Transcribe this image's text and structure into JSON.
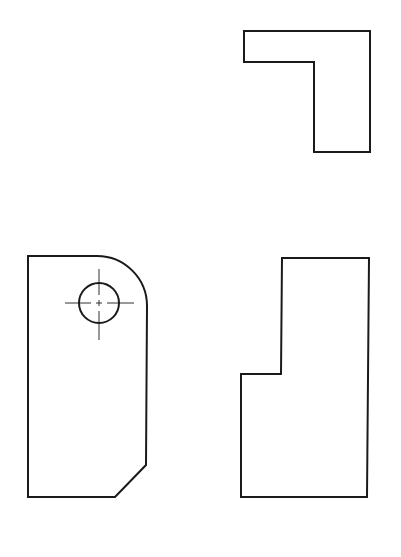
{
  "drawing": {
    "type": "orthographic-projection",
    "stroke_color": "#1a1a1a",
    "background": "#ffffff",
    "views": [
      {
        "name": "top-view",
        "description": "L-shaped outline"
      },
      {
        "name": "front-view",
        "description": "Rounded top-right corner, chamfered bottom-right, with through-hole and centerlines"
      },
      {
        "name": "side-view",
        "description": "Stepped outline"
      }
    ]
  }
}
